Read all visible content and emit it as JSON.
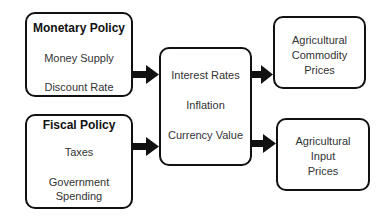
{
  "monetary_policy": {
    "title": "Monetary Policy",
    "items": [
      "Money Supply",
      "Discount Rate"
    ]
  },
  "fiscal_policy": {
    "title": "Fiscal Policy",
    "items": [
      "Taxes",
      "Government",
      "Spending"
    ]
  },
  "macro_factors": {
    "items": [
      "Interest Rates",
      "Inflation",
      "Currency Value"
    ]
  },
  "outcomes": {
    "commodity": [
      "Agricultural",
      "Commodity",
      "Prices"
    ],
    "input": [
      "Agricultural",
      "Input",
      "Prices"
    ]
  }
}
